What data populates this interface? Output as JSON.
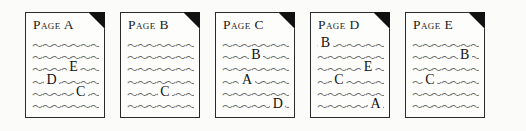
{
  "figure": {
    "type": "document-link-diagram",
    "background_color": "#fbfbfa",
    "page_fill": "#fdfdfc",
    "page_border_color": "#2b2b2b",
    "fold_color": "#111111",
    "squiggle_color": "#6e6e6e",
    "letter_color": "#111111",
    "squiggle_glyph": "〜〜〜〜〜〜〜〜〜〜〜〜〜〜〜〜〜〜〜〜〜〜〜〜〜〜〜〜〜〜",
    "lines_per_page": 6
  },
  "pages": [
    {
      "id": "page-a",
      "title": "Page A",
      "x": 25,
      "links": [
        {
          "label": "E",
          "line": 3,
          "pos": 52
        },
        {
          "label": "D",
          "line": 4,
          "pos": 18
        },
        {
          "label": "C",
          "line": 5,
          "pos": 62
        }
      ]
    },
    {
      "id": "page-b",
      "title": "Page B",
      "x": 120,
      "links": [
        {
          "label": "C",
          "line": 5,
          "pos": 46
        }
      ]
    },
    {
      "id": "page-c",
      "title": "Page C",
      "x": 215,
      "links": [
        {
          "label": "B",
          "line": 2,
          "pos": 40
        },
        {
          "label": "A",
          "line": 4,
          "pos": 26
        },
        {
          "label": "D",
          "line": 6,
          "pos": 72
        }
      ]
    },
    {
      "id": "page-d",
      "title": "Page D",
      "x": 310,
      "links": [
        {
          "label": "B",
          "line": 1,
          "pos": 2
        },
        {
          "label": "E",
          "line": 3,
          "pos": 66
        },
        {
          "label": "C",
          "line": 4,
          "pos": 22
        },
        {
          "label": "A",
          "line": 6,
          "pos": 76
        }
      ]
    },
    {
      "id": "page-e",
      "title": "Page E",
      "x": 405,
      "links": [
        {
          "label": "B",
          "line": 2,
          "pos": 68
        },
        {
          "label": "C",
          "line": 4,
          "pos": 16
        }
      ]
    }
  ]
}
